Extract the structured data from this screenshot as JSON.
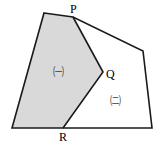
{
  "figure": {
    "background_color": "#ffffff",
    "stroke_color": "#1a1a1a",
    "shaded_fill_color": "#d9d9d9",
    "unshaded_fill_color": "#ffffff",
    "stroke_width": 1.6,
    "outer_polygon": {
      "name": "outer-quadrilateral",
      "points": "44,13 73,17 143,51 152,128 12,128"
    },
    "shaded_region": {
      "name": "region-gi",
      "points": "44,13 73,17 103,72 63,128 12,128"
    },
    "unshaded_region": {
      "name": "region-ni",
      "points": "73,17 143,51 152,128 63,128 103,72"
    },
    "divider_path": {
      "name": "divider-P-Q-R",
      "points": "73,17 103,72 63,128"
    },
    "vertex_labels": [
      {
        "id": "P",
        "text": "P",
        "x": 70,
        "y": 3
      },
      {
        "id": "Q",
        "text": "Q",
        "x": 106,
        "y": 68
      },
      {
        "id": "R",
        "text": "R",
        "x": 59,
        "y": 131
      }
    ],
    "region_labels": [
      {
        "id": "a",
        "text": "㈠",
        "x": 53,
        "y": 67
      },
      {
        "id": "b",
        "text": "㈡",
        "x": 110,
        "y": 96
      }
    ]
  }
}
